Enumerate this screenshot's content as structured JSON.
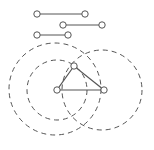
{
  "diagram": {
    "background": "#ffffff",
    "stroke_color": "#555555",
    "node_fill": "#ffffff",
    "segments": [
      {
        "x1": 37,
        "y1": 14,
        "x2": 85,
        "y2": 14
      },
      {
        "x1": 63,
        "y1": 25,
        "x2": 102,
        "y2": 25
      },
      {
        "x1": 37,
        "y1": 35,
        "x2": 68,
        "y2": 35
      }
    ],
    "triangle": {
      "vertices": [
        {
          "x": 74,
          "y": 66
        },
        {
          "x": 57,
          "y": 90
        },
        {
          "x": 104,
          "y": 90
        }
      ]
    },
    "dashed_circles": [
      {
        "cx": 55,
        "cy": 89,
        "r": 46
      },
      {
        "cx": 57,
        "cy": 90,
        "r": 30
      },
      {
        "cx": 102,
        "cy": 90,
        "r": 40
      }
    ]
  }
}
